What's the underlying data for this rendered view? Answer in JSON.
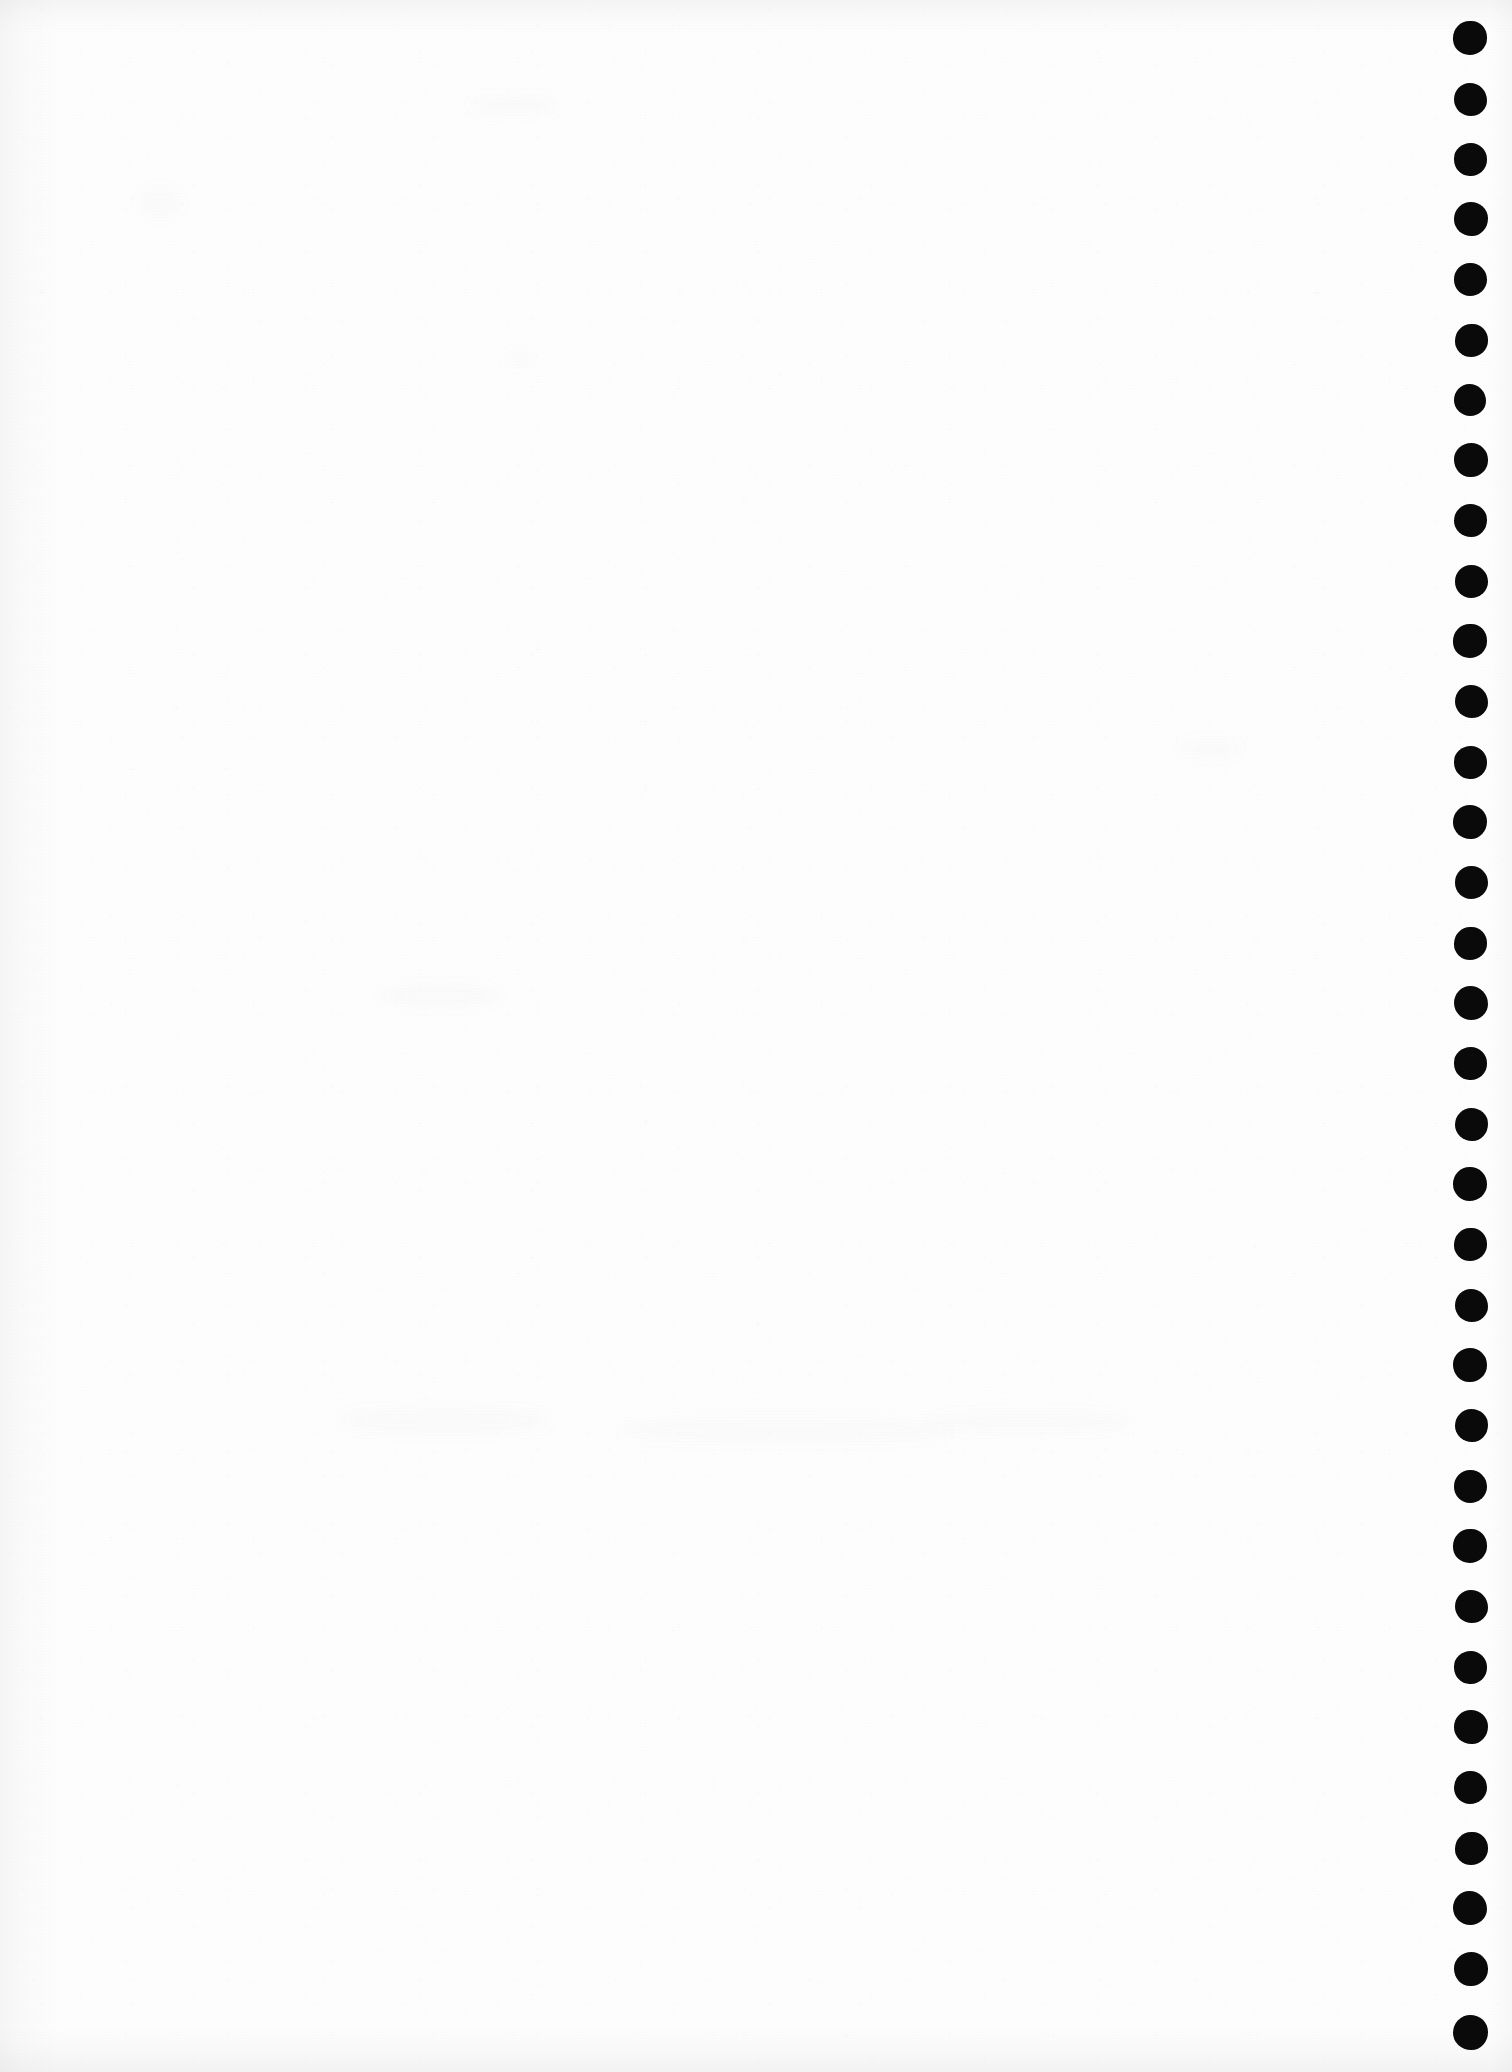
{
  "document": {
    "kind": "scanned-page",
    "title": "Blank scanned notebook page",
    "page_width": 1512,
    "page_height": 2072,
    "background_color": "#fdfdfd",
    "body_text": "",
    "visible_text_count": 0
  },
  "margin_marks": {
    "name": "binding-hole-dots",
    "description": "Column of solid black round punch marks along the right edge",
    "icon": "filled-circle-icon",
    "color": "#0a0a0a",
    "count": 34,
    "center_x": 1470,
    "first_center_y": 38,
    "spacing_y": 60.4,
    "diameter": 33,
    "dots": [
      {
        "index": 1,
        "cy": 38,
        "d": 34,
        "cx": 1470
      },
      {
        "index": 2,
        "cy": 99,
        "d": 33,
        "cx": 1470
      },
      {
        "index": 3,
        "cy": 159,
        "d": 33,
        "cx": 1470
      },
      {
        "index": 4,
        "cy": 219,
        "d": 34,
        "cx": 1471
      },
      {
        "index": 5,
        "cy": 279,
        "d": 33,
        "cx": 1470
      },
      {
        "index": 6,
        "cy": 340,
        "d": 33,
        "cx": 1471
      },
      {
        "index": 7,
        "cy": 400,
        "d": 32,
        "cx": 1470
      },
      {
        "index": 8,
        "cy": 460,
        "d": 34,
        "cx": 1471
      },
      {
        "index": 9,
        "cy": 520,
        "d": 33,
        "cx": 1470
      },
      {
        "index": 10,
        "cy": 581,
        "d": 33,
        "cx": 1471
      },
      {
        "index": 11,
        "cy": 641,
        "d": 34,
        "cx": 1470
      },
      {
        "index": 12,
        "cy": 701,
        "d": 33,
        "cx": 1471
      },
      {
        "index": 13,
        "cy": 762,
        "d": 33,
        "cx": 1470
      },
      {
        "index": 14,
        "cy": 822,
        "d": 34,
        "cx": 1470
      },
      {
        "index": 15,
        "cy": 882,
        "d": 33,
        "cx": 1471
      },
      {
        "index": 16,
        "cy": 943,
        "d": 33,
        "cx": 1470
      },
      {
        "index": 17,
        "cy": 1003,
        "d": 34,
        "cx": 1471
      },
      {
        "index": 18,
        "cy": 1063,
        "d": 33,
        "cx": 1470
      },
      {
        "index": 19,
        "cy": 1124,
        "d": 33,
        "cx": 1471
      },
      {
        "index": 20,
        "cy": 1184,
        "d": 34,
        "cx": 1470
      },
      {
        "index": 21,
        "cy": 1244,
        "d": 33,
        "cx": 1470
      },
      {
        "index": 22,
        "cy": 1305,
        "d": 33,
        "cx": 1471
      },
      {
        "index": 23,
        "cy": 1365,
        "d": 34,
        "cx": 1470
      },
      {
        "index": 24,
        "cy": 1425,
        "d": 33,
        "cx": 1471
      },
      {
        "index": 25,
        "cy": 1486,
        "d": 33,
        "cx": 1470
      },
      {
        "index": 26,
        "cy": 1546,
        "d": 34,
        "cx": 1470
      },
      {
        "index": 27,
        "cy": 1606,
        "d": 33,
        "cx": 1471
      },
      {
        "index": 28,
        "cy": 1667,
        "d": 33,
        "cx": 1470
      },
      {
        "index": 29,
        "cy": 1727,
        "d": 34,
        "cx": 1471
      },
      {
        "index": 30,
        "cy": 1787,
        "d": 33,
        "cx": 1470
      },
      {
        "index": 31,
        "cy": 1848,
        "d": 33,
        "cx": 1471
      },
      {
        "index": 32,
        "cy": 1908,
        "d": 34,
        "cx": 1470
      },
      {
        "index": 33,
        "cy": 1969,
        "d": 34,
        "cx": 1471
      },
      {
        "index": 34,
        "cy": 2032,
        "d": 35,
        "cx": 1470
      }
    ]
  },
  "ghost_marks": [
    {
      "x": 470,
      "y": 96,
      "w": 90,
      "h": 18
    },
    {
      "x": 505,
      "y": 352,
      "w": 26,
      "h": 14
    },
    {
      "x": 380,
      "y": 985,
      "w": 120,
      "h": 22
    },
    {
      "x": 340,
      "y": 1408,
      "w": 210,
      "h": 26
    },
    {
      "x": 620,
      "y": 1418,
      "w": 330,
      "h": 24
    },
    {
      "x": 930,
      "y": 1412,
      "w": 200,
      "h": 20
    },
    {
      "x": 140,
      "y": 188,
      "w": 40,
      "h": 30
    },
    {
      "x": 1180,
      "y": 740,
      "w": 60,
      "h": 18
    }
  ]
}
